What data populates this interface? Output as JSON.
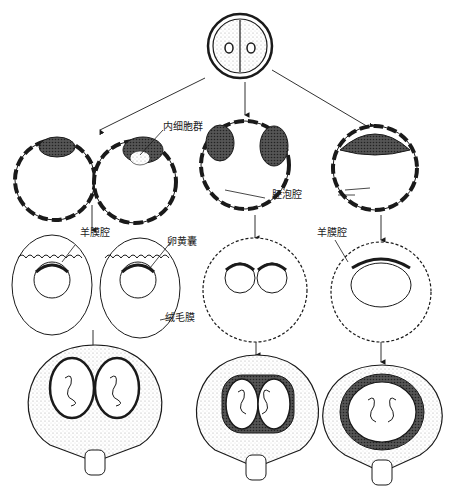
{
  "diagram": {
    "labels": {
      "inner_cell_mass": "内细胞群",
      "blastocoel": "胚泡腔",
      "amniotic_cavity_left": "羊膜腔",
      "yolk_sac": "卵黄囊",
      "chorion": "绒毛膜",
      "amniotic_cavity_right": "羊膜腔"
    },
    "colors": {
      "ink": "#1a1a1a",
      "background": "#ffffff",
      "shade": "#888888"
    }
  }
}
